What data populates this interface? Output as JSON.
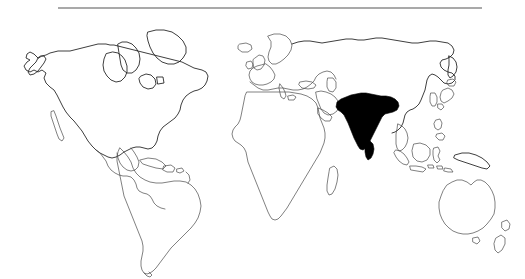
{
  "figure": {
    "type": "world-outline-map",
    "title": "",
    "caption": "",
    "background_color": "#ffffff",
    "width": 525,
    "height": 279
  },
  "divider": {
    "name": "top-horizontal-rule",
    "x_start": 58,
    "x_end": 482,
    "y": 8,
    "color": "#555555",
    "thickness": 1.2
  },
  "styles": {
    "coastline_color": "#4a4a4a",
    "coastline_color_dark": "#1c1c1c",
    "coastline_width": 0.7,
    "highlight_fill": "#000000",
    "land_fill": "none"
  },
  "highlight": {
    "label": "India",
    "fill_color": "#000000",
    "includes": [
      "Indian subcontinent",
      "Sri Lanka"
    ],
    "bbox": {
      "x": 336,
      "y": 92,
      "width": 66,
      "height": 70
    }
  },
  "landmasses": [
    {
      "name": "north-america",
      "label": "North America",
      "filled": false
    },
    {
      "name": "greenland",
      "label": "Greenland",
      "filled": false
    },
    {
      "name": "central-america",
      "label": "Central America",
      "filled": false
    },
    {
      "name": "caribbean-islands",
      "label": "Caribbean Islands",
      "filled": false
    },
    {
      "name": "south-america",
      "label": "South America",
      "filled": false
    },
    {
      "name": "europe",
      "label": "Europe",
      "filled": false
    },
    {
      "name": "british-isles",
      "label": "British Isles",
      "filled": false
    },
    {
      "name": "iceland",
      "label": "Iceland",
      "filled": false
    },
    {
      "name": "scandinavia",
      "label": "Scandinavia",
      "filled": false
    },
    {
      "name": "africa",
      "label": "Africa",
      "filled": false
    },
    {
      "name": "madagascar",
      "label": "Madagascar",
      "filled": false
    },
    {
      "name": "arabian-peninsula",
      "label": "Arabian Peninsula",
      "filled": false
    },
    {
      "name": "asia",
      "label": "Asia",
      "filled": false
    },
    {
      "name": "india",
      "label": "India",
      "filled": true
    },
    {
      "name": "sri-lanka",
      "label": "Sri Lanka",
      "filled": true
    },
    {
      "name": "japan",
      "label": "Japan",
      "filled": false
    },
    {
      "name": "korea",
      "label": "Korean Peninsula",
      "filled": false
    },
    {
      "name": "indonesia",
      "label": "Indonesia",
      "filled": false
    },
    {
      "name": "philippines",
      "label": "Philippines",
      "filled": false
    },
    {
      "name": "new-guinea",
      "label": "New Guinea",
      "filled": false
    },
    {
      "name": "australia",
      "label": "Australia",
      "filled": false
    },
    {
      "name": "tasmania",
      "label": "Tasmania",
      "filled": false
    },
    {
      "name": "new-zealand",
      "label": "New Zealand",
      "filled": false
    }
  ],
  "accessibility": {
    "description": "Outline world map with the Indian subcontinent and Sri Lanka shaded solid black; a thin horizontal rule spans the upper portion of the image."
  }
}
